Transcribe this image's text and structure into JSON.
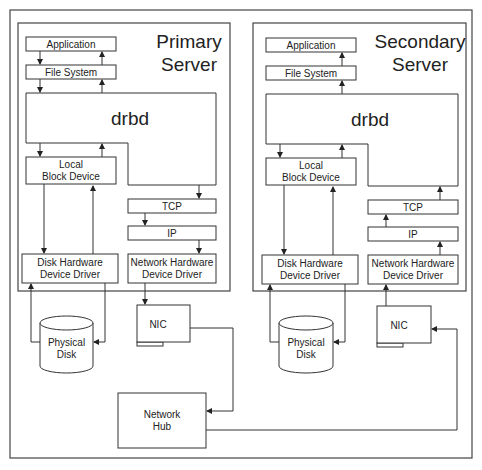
{
  "diagram": {
    "primary": {
      "title_line1": "Primary",
      "title_line2": "Server",
      "application": "Application",
      "file_system": "File System",
      "drbd": "drbd",
      "local_block_line1": "Local",
      "local_block_line2": "Block Device",
      "tcp": "TCP",
      "ip": "IP",
      "disk_driver_line1": "Disk Hardware",
      "disk_driver_line2": "Device Driver",
      "net_driver_line1": "Network Hardware",
      "net_driver_line2": "Device Driver",
      "disk_line1": "Physical",
      "disk_line2": "Disk",
      "nic": "NIC"
    },
    "secondary": {
      "title_line1": "Secondary",
      "title_line2": "Server",
      "application": "Application",
      "file_system": "File System",
      "drbd": "drbd",
      "local_block_line1": "Local",
      "local_block_line2": "Block Device",
      "tcp": "TCP",
      "ip": "IP",
      "disk_driver_line1": "Disk Hardware",
      "disk_driver_line2": "Device Driver",
      "net_driver_line1": "Network Hardware",
      "net_driver_line2": "Device Driver",
      "disk_line1": "Physical",
      "disk_line2": "Disk",
      "nic": "NIC"
    },
    "hub": {
      "line1": "Network",
      "line2": "Hub"
    },
    "colors": {
      "stroke": "#333333",
      "background": "#ffffff",
      "text": "#222222"
    }
  }
}
